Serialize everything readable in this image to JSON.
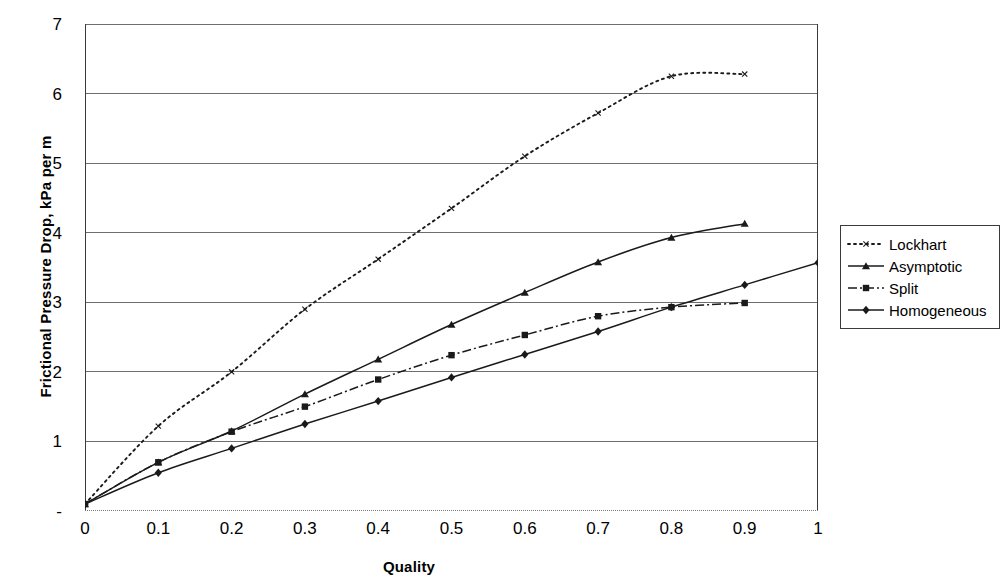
{
  "chart_data": {
    "type": "line",
    "title": "",
    "xlabel": "Quality",
    "ylabel": "Frictional Pressure Drop, kPa per m",
    "xlim": [
      0,
      1
    ],
    "ylim": [
      0,
      7
    ],
    "xticks": [
      "0",
      "0.1",
      "0.2",
      "0.3",
      "0.4",
      "0.5",
      "0.6",
      "0.7",
      "0.8",
      "0.9",
      "1"
    ],
    "xtick_values": [
      0,
      0.1,
      0.2,
      0.3,
      0.4,
      0.5,
      0.6,
      0.7,
      0.8,
      0.9,
      1
    ],
    "yticks": [
      "-",
      "1",
      "2",
      "3",
      "4",
      "5",
      "6",
      "7"
    ],
    "ytick_values": [
      0,
      1,
      2,
      3,
      4,
      5,
      6,
      7
    ],
    "grid": "horizontal",
    "legend_position": "right",
    "series": [
      {
        "name": "Lockhart",
        "marker": "x",
        "linestyle": "dotted",
        "color": "#1a1a1a",
        "x": [
          0,
          0.1,
          0.2,
          0.3,
          0.4,
          0.5,
          0.6,
          0.7,
          0.8,
          0.9
        ],
        "values": [
          0.1,
          1.22,
          2.0,
          2.9,
          3.62,
          4.35,
          5.1,
          5.72,
          6.25,
          6.28
        ]
      },
      {
        "name": "Asymptotic",
        "marker": "triangle",
        "linestyle": "solid",
        "color": "#1a1a1a",
        "x": [
          0,
          0.1,
          0.2,
          0.3,
          0.4,
          0.5,
          0.6,
          0.7,
          0.8,
          0.9
        ],
        "values": [
          0.1,
          0.7,
          1.15,
          1.68,
          2.18,
          2.68,
          3.14,
          3.58,
          3.93,
          4.13
        ]
      },
      {
        "name": "Split",
        "marker": "square",
        "linestyle": "dashdot",
        "color": "#1a1a1a",
        "x": [
          0,
          0.1,
          0.2,
          0.3,
          0.4,
          0.5,
          0.6,
          0.7,
          0.8,
          0.9
        ],
        "values": [
          0.1,
          0.7,
          1.14,
          1.5,
          1.89,
          2.24,
          2.53,
          2.8,
          2.93,
          2.99
        ]
      },
      {
        "name": "Homogeneous",
        "marker": "diamond",
        "linestyle": "solid",
        "color": "#1a1a1a",
        "x": [
          0,
          0.1,
          0.2,
          0.3,
          0.4,
          0.5,
          0.6,
          0.7,
          0.8,
          0.9,
          1
        ],
        "values": [
          0.1,
          0.55,
          0.9,
          1.25,
          1.58,
          1.92,
          2.25,
          2.58,
          2.93,
          3.25,
          3.57
        ]
      }
    ]
  }
}
